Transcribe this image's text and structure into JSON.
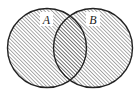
{
  "diagram": {
    "type": "venn",
    "shaded_region": "A ∪ B",
    "sets": [
      {
        "label": "A",
        "cx": 47,
        "cy": 48,
        "r": 39.5
      },
      {
        "label": "B",
        "cx": 93,
        "cy": 48,
        "r": 39.5
      }
    ],
    "colors": {
      "stroke": "#222222",
      "hatch": "#555555",
      "background": "#ffffff",
      "label_box": "#ffffff"
    }
  }
}
